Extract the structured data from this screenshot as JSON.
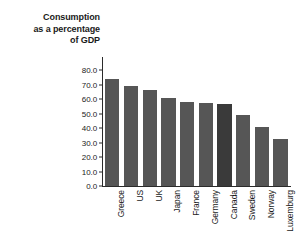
{
  "chart_data": {
    "type": "bar",
    "title": "Consumption as a percentage of GDP",
    "title_lines": [
      "Consumption",
      "as a percentage",
      "of GDP"
    ],
    "xlabel": "",
    "ylabel": "",
    "ylim": [
      0.0,
      80.0
    ],
    "ytick_step": 10.0,
    "ytick_labels": [
      "80.0",
      "70.0",
      "60.0",
      "50.0",
      "40.0",
      "30.0",
      "20.0",
      "10.0",
      "0.0"
    ],
    "ytick_values": [
      80.0,
      70.0,
      60.0,
      50.0,
      40.0,
      30.0,
      20.0,
      10.0,
      0.0
    ],
    "grid": false,
    "legend": "none",
    "categories": [
      "Greece",
      "US",
      "UK",
      "Japan",
      "France",
      "Germany",
      "Canada",
      "Sweden",
      "Norway",
      "Luxemburg"
    ],
    "values": [
      73.5,
      68.7,
      66.0,
      60.6,
      58.0,
      57.0,
      56.8,
      48.8,
      40.6,
      32.2
    ],
    "highlight_category": "Canada",
    "colors": {
      "bar": "#565656",
      "bar_highlight": "#3a3a3a",
      "axis": "#2b2b2b",
      "text": "#1a1a1a",
      "background": "#ffffff"
    }
  }
}
